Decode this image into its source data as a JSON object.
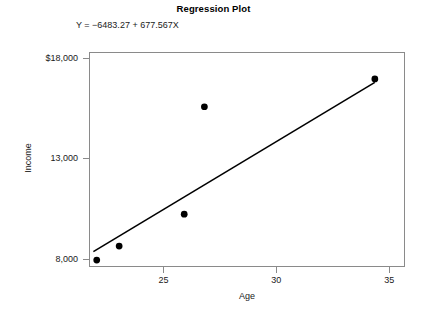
{
  "chart_data": {
    "type": "scatter",
    "title": "Regression Plot",
    "annotation": "Y = −6483.27 + 677.567X",
    "xlabel": "Age",
    "ylabel": "Income",
    "xlim": [
      21.7,
      35.7
    ],
    "ylim": [
      7600,
      18300
    ],
    "grid": false,
    "legend": "none",
    "xticks": [
      25,
      30,
      35
    ],
    "xtick_labels": [
      "25",
      "30",
      "35"
    ],
    "yticks": [
      8000,
      13000,
      18000
    ],
    "ytick_labels": [
      "8,000",
      "13,000",
      "$18,000"
    ],
    "points": [
      {
        "x": 22.0,
        "y": 7900
      },
      {
        "x": 23.0,
        "y": 8600
      },
      {
        "x": 25.9,
        "y": 10200
      },
      {
        "x": 26.8,
        "y": 15600
      },
      {
        "x": 34.4,
        "y": 17000
      }
    ],
    "fit_line": {
      "intercept": -6483.27,
      "slope": 677.567,
      "x_start": 21.85,
      "x_end": 34.4
    }
  }
}
